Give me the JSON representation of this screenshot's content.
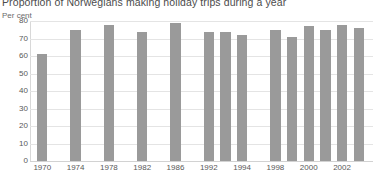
{
  "chart_data": {
    "type": "bar",
    "title": "Proportion of Norwegians making holiday trips during a year",
    "ylabel": "Per cent",
    "xlabel": "",
    "ylim": [
      0,
      80
    ],
    "yticks": [
      0,
      10,
      20,
      30,
      40,
      50,
      60,
      70,
      80
    ],
    "grid": true,
    "legend": null,
    "bar_color": "#9a9a9a",
    "gridline_color": "#e4e4e4",
    "categories": [
      "1970",
      "1974",
      "1978",
      "1982",
      "1986",
      "1992",
      "1993",
      "1994",
      "1998",
      "1999",
      "2000",
      "2001",
      "2002",
      "2003"
    ],
    "values": [
      61,
      75,
      78,
      74,
      79,
      74,
      74,
      72,
      75,
      71,
      77,
      75,
      78,
      76
    ],
    "xtick_labels": [
      "1970",
      "1974",
      "1978",
      "1982",
      "1986",
      "1992",
      "1994",
      "1998",
      "2000",
      "2002"
    ]
  },
  "axis": {
    "unit_label": "Per cent"
  }
}
